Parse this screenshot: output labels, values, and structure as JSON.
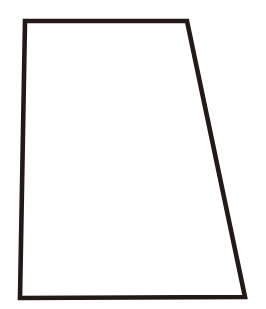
{
  "document": {
    "title": "Quadrilateral Shape Figure",
    "background_color": "#ffffff",
    "width": 266,
    "height": 309
  },
  "figure": {
    "name": "quadrilateral-outline",
    "shape_type": "quadrilateral",
    "description": "Trapezoid outline drawing",
    "stroke_color": "#231a17",
    "fill_color": "#ffffff",
    "stroke_width": 4.6,
    "closed": true,
    "vertices": [
      {
        "label": "top-left",
        "x": 25,
        "y": 21
      },
      {
        "label": "top-right",
        "x": 187,
        "y": 21
      },
      {
        "label": "bottom-right",
        "x": 245,
        "y": 297
      },
      {
        "label": "bottom-left",
        "x": 20,
        "y": 298
      }
    ],
    "path": "M 25 21 L 187 21 L 245 297 L 20 298 Z",
    "edges": [
      {
        "name": "top-edge",
        "from": "top-left",
        "to": "top-right"
      },
      {
        "name": "right-edge",
        "from": "top-right",
        "to": "bottom-right"
      },
      {
        "name": "bottom-edge",
        "from": "bottom-right",
        "to": "bottom-left"
      },
      {
        "name": "left-edge",
        "from": "bottom-left",
        "to": "top-left"
      }
    ]
  }
}
